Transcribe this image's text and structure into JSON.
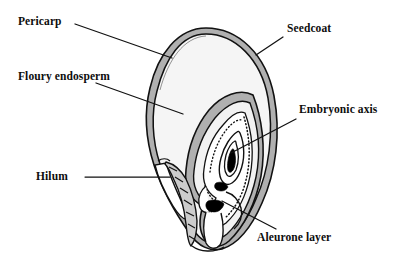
{
  "figure": {
    "background_color": "#ffffff",
    "line_color": "#111111",
    "seedcoat_fill": "#b3b3b3",
    "endosperm_fill": "#f4f4f4",
    "embryo_dark_fill": "#000000"
  },
  "labels": [
    {
      "id": "pericarp",
      "text": "Pericarp"
    },
    {
      "id": "floury_endosperm",
      "text": "Floury endosperm"
    },
    {
      "id": "hilum",
      "text": "Hilum"
    },
    {
      "id": "seedcoat",
      "text": "Seedcoat"
    },
    {
      "id": "embryonic_axis",
      "text": "Embryonic axis"
    },
    {
      "id": "aleurone_layer",
      "text": "Aleurone layer"
    }
  ]
}
